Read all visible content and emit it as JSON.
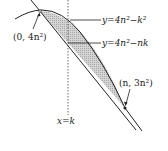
{
  "figure": {
    "type": "area-between-curves",
    "curves": [
      {
        "id": "parabola",
        "label": "y=4n²−k²",
        "kind": "parabola"
      },
      {
        "id": "line",
        "label": "y=4n²−nk",
        "kind": "line"
      }
    ],
    "points": [
      {
        "id": "top",
        "label": "(0, 4n²)"
      },
      {
        "id": "bottom",
        "label": "(n, 3n²)"
      }
    ],
    "vertical_line": {
      "label": "x=k",
      "style": "dashed"
    },
    "shaded_region": {
      "between": [
        "parabola",
        "line"
      ],
      "pattern": "dotted-gray"
    }
  },
  "labels": {
    "parabola": "y=4n²−k²",
    "line": "y=4n²−nk",
    "point_top": "(0, 4n²)",
    "point_bottom": "(n, 3n²)",
    "vline": "x=k"
  },
  "colors": {
    "stroke": "#222222",
    "shade": "#c8c8c8",
    "background": "#ffffff"
  }
}
